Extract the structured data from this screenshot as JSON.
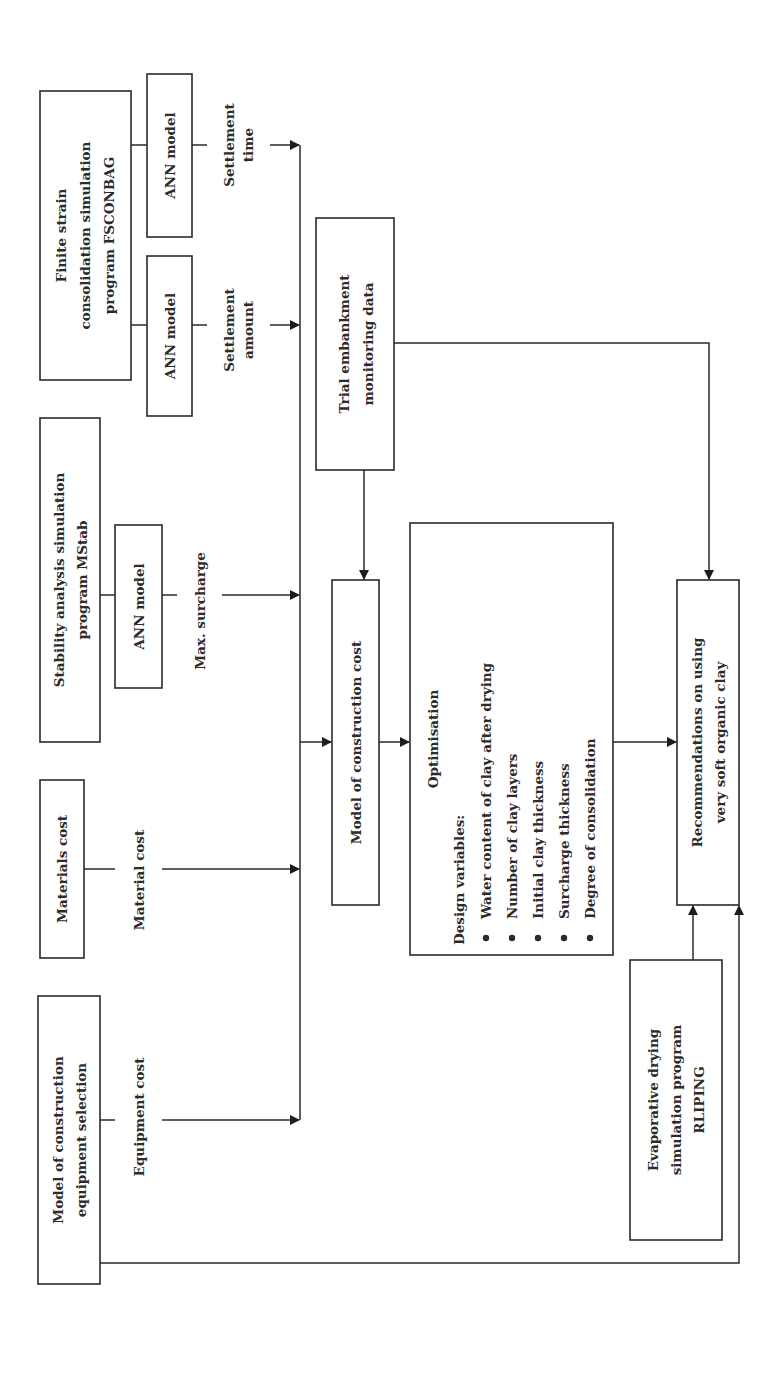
{
  "diagram": {
    "orientation": "rotated-90-ccw",
    "colors": {
      "stroke": "#2a2a2a",
      "text": "#2b2b2b",
      "background": "#ffffff"
    },
    "nodes": {
      "fsconbag": {
        "lines": [
          "Finite strain",
          "consolidation simulation",
          "program FSCONBAG"
        ]
      },
      "ann_time": {
        "lines": [
          "ANN model"
        ]
      },
      "ann_amount": {
        "lines": [
          "ANN model"
        ]
      },
      "mstab": {
        "lines": [
          "Stability analysis simulation",
          "program MStab"
        ]
      },
      "ann_surcharge": {
        "lines": [
          "ANN model"
        ]
      },
      "materials": {
        "lines": [
          "Materials cost"
        ]
      },
      "equipment": {
        "lines": [
          "Model of construction",
          "equipment selection"
        ]
      },
      "trial": {
        "lines": [
          "Trial embankment",
          "monitoring data"
        ]
      },
      "construction_cost": {
        "lines": [
          "Model of construction cost"
        ]
      },
      "optimisation": {
        "title": "Optimisation",
        "subtitle": "Design variables:",
        "items": [
          "Water content of clay after drying",
          "Number of clay layers",
          "Initial clay thickness",
          "Surcharge thickness",
          "Degree of consolidation"
        ]
      },
      "recommendations": {
        "lines": [
          "Recommendations on using",
          "very soft organic clay"
        ]
      },
      "rliping": {
        "lines": [
          "Evaporative drying",
          "simulation program",
          "RLIPING"
        ]
      }
    },
    "edges": {
      "settlement_time": {
        "lines": [
          "Settlement",
          "time"
        ]
      },
      "settlement_amount": {
        "lines": [
          "Settlement",
          "amount"
        ]
      },
      "max_surcharge": {
        "lines": [
          "Max. surcharge"
        ]
      },
      "material_cost": {
        "lines": [
          "Material cost"
        ]
      },
      "equipment_cost": {
        "lines": [
          "Equipment cost"
        ]
      }
    }
  }
}
